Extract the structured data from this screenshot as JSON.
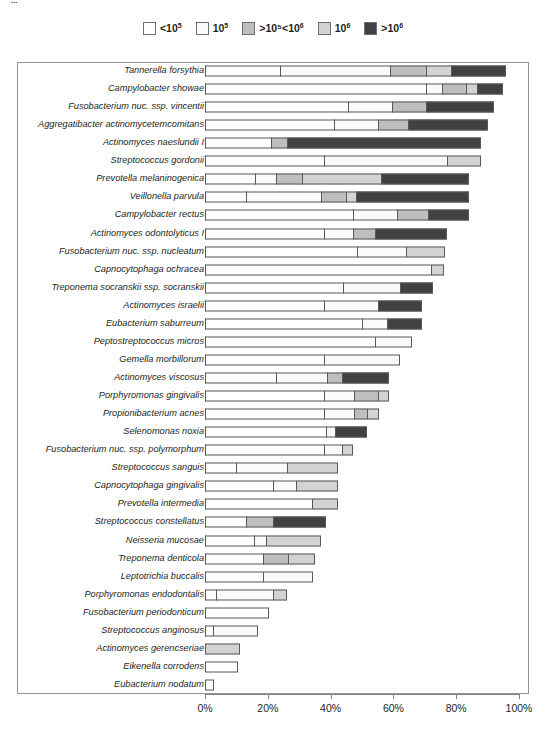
{
  "top_caption": "...",
  "legend": {
    "position": "top-center",
    "items": [
      {
        "label": "<10⁵",
        "base": "<10",
        "exp": "5",
        "color": "#ffffff"
      },
      {
        "label": "10⁵",
        "base": "10",
        "exp": "5",
        "color": "#fafafa"
      },
      {
        "label": ">10⁵<10⁶",
        "base": ">10⁵<10",
        "exp": "6",
        "color": "#bcbec0"
      },
      {
        "label": "10⁶",
        "base": "10",
        "exp": "6",
        "color": "#d1d3d4"
      },
      {
        "label": ">10⁶",
        "base": ">10",
        "exp": "6",
        "color": "#414042"
      }
    ]
  },
  "axis": {
    "ticks": [
      "0%",
      "20%",
      "40%",
      "60%",
      "80%",
      "100%"
    ],
    "tick_values": [
      0,
      20,
      40,
      60,
      80,
      100
    ],
    "min": 0,
    "max": 100
  },
  "chart_data": {
    "type": "bar",
    "orientation": "horizontal",
    "stacked": true,
    "title": "",
    "xlabel": "",
    "ylabel": "",
    "xlim": [
      0,
      100
    ],
    "grid": false,
    "legend_position": "top-center",
    "series": [
      {
        "name": "<10⁵",
        "color": "#ffffff"
      },
      {
        "name": "10⁵",
        "color": "#fafafa"
      },
      {
        "name": ">10⁵<10⁶",
        "color": "#bcbec0"
      },
      {
        "name": "10⁶",
        "color": "#d1d3d4"
      },
      {
        "name": ">10⁶",
        "color": "#414042"
      }
    ],
    "categories": [
      "Tannerella forsythia",
      "Campylobacter showae",
      "Fusobacterium nuc. ssp. vincentii",
      "Aggregatibacter actinomycetemcomitans",
      "Actinomyces naeslundii I",
      "Streptococcus gordonii",
      "Prevotella melaninogenica",
      "Veillonella parvula",
      "Campylobacter rectus",
      "Actinomyces odontolyticus I",
      "Fusobacterium nuc. ssp. nucleatum",
      "Capnocytophaga ochracea",
      "Treponema socranskii ssp. socranskii",
      "Actinomyces israelii",
      "Eubacterium saburreum",
      "Peptostreptococcus micros",
      "Gemella morbillorum",
      "Actinomyces viscosus",
      "Porphyromonas gingivalis",
      "Propionibacterium acnes",
      "Selenomonas noxia",
      "Fusobacterium nuc. ssp. polymorphum",
      "Streptococcus sanguis",
      "Capnocytophaga gingivalis",
      "Prevotella intermedia",
      "Streptococcus constellatus",
      "Neisseria mucosae",
      "Treponema denticola",
      "Leptotrichia buccalis",
      "Porphyromonas endodontalis",
      "Fusobacterium periodonticum",
      "Streptococcus anginosus",
      "Actinomyces gerencseriae",
      "Eikenella corrodens",
      "Eubacterium nodatum"
    ],
    "rows": [
      {
        "name": "Tannerella forsythia",
        "segments": [
          24.0,
          35.0,
          11.5,
          8.0,
          17.5
        ],
        "total": 96.0
      },
      {
        "name": "Campylobacter showae",
        "segments": [
          70.5,
          5.0,
          7.5,
          3.5,
          8.5
        ],
        "total": 95.0
      },
      {
        "name": "Fusobacterium nuc. ssp. vincentii",
        "segments": [
          45.5,
          14.0,
          11.0,
          0.0,
          21.5
        ],
        "total": 92.0
      },
      {
        "name": "Aggregatibacter actinomycetemcomitans",
        "segments": [
          41.0,
          14.0,
          9.5,
          0.0,
          25.5
        ],
        "total": 90.0
      },
      {
        "name": "Actinomyces naeslundii I",
        "segments": [
          21.0,
          0.0,
          5.0,
          0.0,
          62.0
        ],
        "total": 88.0
      },
      {
        "name": "Streptococcus gordonii",
        "segments": [
          38.0,
          39.0,
          0.0,
          11.0,
          0.0
        ],
        "total": 88.0
      },
      {
        "name": "Prevotella melaninogenica",
        "segments": [
          16.0,
          6.5,
          8.5,
          25.0,
          28.0
        ],
        "total": 84.0
      },
      {
        "name": "Veillonella parvula",
        "segments": [
          13.0,
          24.0,
          8.0,
          3.0,
          36.0
        ],
        "total": 84.0
      },
      {
        "name": "Campylobacter rectus",
        "segments": [
          47.0,
          14.0,
          10.0,
          0.0,
          13.0
        ],
        "total": 84.0
      },
      {
        "name": "Actinomyces odontolyticus I",
        "segments": [
          38.0,
          9.0,
          7.0,
          0.0,
          23.0
        ],
        "total": 77.0
      },
      {
        "name": "Fusobacterium nuc. ssp. nucleatum",
        "segments": [
          48.5,
          15.5,
          0.0,
          12.5,
          0.0
        ],
        "total": 76.5
      },
      {
        "name": "Capnocytophaga ochracea",
        "segments": [
          72.0,
          0.0,
          0.0,
          4.0,
          0.0
        ],
        "total": 76.0
      },
      {
        "name": "Treponema socranskii ssp. socranskii",
        "segments": [
          44.0,
          18.0,
          0.0,
          0.0,
          10.5
        ],
        "total": 72.5
      },
      {
        "name": "Actinomyces israelii",
        "segments": [
          38.0,
          17.0,
          0.0,
          0.0,
          14.0
        ],
        "total": 69.0
      },
      {
        "name": "Eubacterium saburreum",
        "segments": [
          50.0,
          8.0,
          0.0,
          0.0,
          11.0
        ],
        "total": 69.0
      },
      {
        "name": "Peptostreptococcus micros",
        "segments": [
          54.0,
          12.0,
          0.0,
          0.0,
          0.0
        ],
        "total": 66.0
      },
      {
        "name": "Gemella morbillorum",
        "segments": [
          38.0,
          24.0,
          0.0,
          0.0,
          0.0
        ],
        "total": 62.0
      },
      {
        "name": "Actinomyces viscosus",
        "segments": [
          22.5,
          16.5,
          4.5,
          0.0,
          15.0
        ],
        "total": 58.5
      },
      {
        "name": "Porphyromonas gingivalis",
        "segments": [
          38.0,
          9.5,
          7.5,
          3.5,
          0.0
        ],
        "total": 58.5
      },
      {
        "name": "Propionibacterium acnes",
        "segments": [
          38.0,
          9.5,
          4.0,
          4.0,
          0.0
        ],
        "total": 55.5
      },
      {
        "name": "Selenomonas noxia",
        "segments": [
          38.5,
          3.0,
          0.0,
          0.0,
          10.0
        ],
        "total": 51.5
      },
      {
        "name": "Fusobacterium nuc. ssp. polymorphum",
        "segments": [
          38.0,
          5.5,
          0.0,
          3.5,
          0.0
        ],
        "total": 47.0
      },
      {
        "name": "Streptococcus sanguis",
        "segments": [
          10.0,
          16.0,
          0.0,
          16.5,
          0.0
        ],
        "total": 42.5
      },
      {
        "name": "Capnocytophaga gingivalis",
        "segments": [
          21.5,
          7.5,
          0.0,
          13.5,
          0.0
        ],
        "total": 42.5
      },
      {
        "name": "Prevotella intermedia",
        "segments": [
          34.0,
          0.0,
          0.0,
          8.5,
          0.0
        ],
        "total": 42.5
      },
      {
        "name": "Streptococcus constellatus",
        "segments": [
          13.0,
          0.0,
          8.5,
          0.0,
          17.0
        ],
        "total": 38.5
      },
      {
        "name": "Neisseria mucosae",
        "segments": [
          15.5,
          4.0,
          0.0,
          17.5,
          0.0
        ],
        "total": 37.0
      },
      {
        "name": "Treponema denticola",
        "segments": [
          18.5,
          0.0,
          8.0,
          8.5,
          0.0
        ],
        "total": 35.0
      },
      {
        "name": "Leptotrichia buccalis",
        "segments": [
          18.5,
          16.0,
          0.0,
          0.0,
          0.0
        ],
        "total": 34.5
      },
      {
        "name": "Porphyromonas endodontalis",
        "segments": [
          3.5,
          18.0,
          0.0,
          4.5,
          0.0
        ],
        "total": 26.0
      },
      {
        "name": "Fusobacterium periodonticum",
        "segments": [
          20.5,
          0.0,
          0.0,
          0.0,
          0.0
        ],
        "total": 20.5
      },
      {
        "name": "Streptococcus anginosus",
        "segments": [
          2.5,
          14.5,
          0.0,
          0.0,
          0.0
        ],
        "total": 17.0
      },
      {
        "name": "Actinomyces gerencseriae",
        "segments": [
          0.0,
          0.0,
          0.0,
          11.0,
          0.0
        ],
        "total": 11.0
      },
      {
        "name": "Eikenella corrodens",
        "segments": [
          10.5,
          0.0,
          0.0,
          0.0,
          0.0
        ],
        "total": 10.5
      },
      {
        "name": "Eubacterium nodatum",
        "segments": [
          3.0,
          0.0,
          0.0,
          0.0,
          0.0
        ],
        "total": 3.0
      }
    ]
  }
}
